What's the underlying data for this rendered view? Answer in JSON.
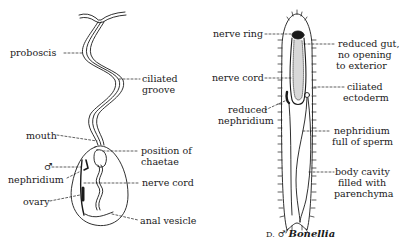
{
  "figures": [
    {
      "id": "female-bonellia",
      "labels": {
        "proboscis": "proboscis",
        "ciliated_groove_1": "ciliated",
        "ciliated_groove_2": "groove",
        "mouth": "mouth",
        "chaetae_1": "position of",
        "chaetae_2": "chaetae",
        "male_symbol": "♂",
        "nephridium": "nephridium",
        "nerve_cord": "nerve cord",
        "ovary": "ovary",
        "anal_vesicle": "anal vesicle"
      }
    },
    {
      "id": "male-bonellia",
      "labels": {
        "nerve_ring": "nerve ring",
        "reduced_gut_1": "reduced gut,",
        "reduced_gut_2": "no opening",
        "reduced_gut_3": "to exterior",
        "nerve_cord": "nerve cord",
        "ciliated_ectoderm_1": "ciliated",
        "ciliated_ectoderm_2": "ectoderm",
        "reduced_nephridium_1": "reduced",
        "reduced_nephridium_2": "nephridium",
        "nephridium_sperm_1": "nephridium",
        "nephridium_sperm_2": "full of sperm",
        "body_cavity_1": "body cavity",
        "body_cavity_2": "filled with",
        "body_cavity_3": "parenchyma"
      },
      "caption": {
        "prefix": "D.",
        "symbol": "♂",
        "name": "Bonellia"
      }
    }
  ]
}
